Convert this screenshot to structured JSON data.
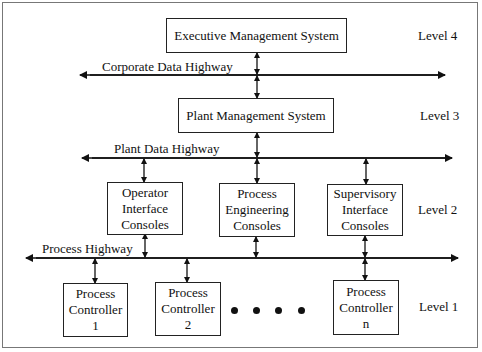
{
  "diagram": {
    "type": "hierarchical network architecture",
    "boxes": {
      "executive": "Executive Management System",
      "plant": "Plant Management System",
      "operator": [
        "Operator",
        "Interface",
        "Consoles"
      ],
      "engineering": [
        "Process",
        "Engineering",
        "Consoles"
      ],
      "supervisory": [
        "Supervisory",
        "Interface",
        "Consoles"
      ],
      "pc1": [
        "Process",
        "Controller",
        "1"
      ],
      "pc2": [
        "Process",
        "Controller",
        "2"
      ],
      "pcn": [
        "Process",
        "Controller",
        "n"
      ]
    },
    "highways": {
      "corporate": "Corporate Data Highway",
      "plant": "Plant Data Highway",
      "process": "Process Highway"
    },
    "levels": {
      "l4": "Level 4",
      "l3": "Level 3",
      "l2": "Level 2",
      "l1": "Level 1"
    },
    "ellipsis_dots": 4,
    "colors": {
      "line": "#111111",
      "frame": "#777777",
      "background": "#ffffff"
    }
  }
}
